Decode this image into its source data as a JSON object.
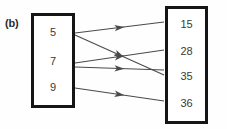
{
  "figure": {
    "label": "(b)",
    "type": "mapping-diagram"
  },
  "domain_set": {
    "name": "left-set",
    "members": [
      {
        "value": "5",
        "y": 33
      },
      {
        "value": "7",
        "y": 62
      },
      {
        "value": "9",
        "y": 88
      }
    ]
  },
  "codomain_set": {
    "name": "right-set",
    "members": [
      {
        "value": "15",
        "y": 25
      },
      {
        "value": "28",
        "y": 52
      },
      {
        "value": "35",
        "y": 77
      },
      {
        "value": "36",
        "y": 104
      }
    ]
  },
  "mappings": [
    {
      "from": "5",
      "to": "15",
      "x1": 75,
      "y1": 33,
      "x2": 164,
      "y2": 22
    },
    {
      "from": "5",
      "to": "35",
      "x1": 75,
      "y1": 35,
      "x2": 164,
      "y2": 75
    },
    {
      "from": "7",
      "to": "28",
      "x1": 75,
      "y1": 63,
      "x2": 164,
      "y2": 50
    },
    {
      "from": "7",
      "to": "35",
      "x1": 75,
      "y1": 67,
      "x2": 164,
      "y2": 70
    },
    {
      "from": "9",
      "to": "36",
      "x1": 75,
      "y1": 88,
      "x2": 164,
      "y2": 101
    }
  ],
  "colors": {
    "box_border": "#151515",
    "arrow": "#4a4a4a",
    "text": "#3a3a3a",
    "label": "#2b2b2b",
    "background": "#fefefe"
  }
}
